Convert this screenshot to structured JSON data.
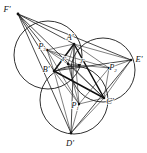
{
  "figure": {
    "type": "geometry-diagram",
    "background_color": "#ffffff",
    "stroke_color": "#1a1a1a",
    "width": 147,
    "height": 153
  },
  "labels": {
    "F_prime": "F'",
    "A_prime": "A'",
    "E_prime": "E'",
    "C_prime": "C'",
    "D_prime": "D'",
    "B_prime": "B'",
    "I_prime": "I'",
    "J_prime": "J'",
    "P1": "P",
    "P1_sub": "1",
    "P2": "P",
    "P2_sub": "2",
    "P3": "P",
    "P3_sub": "3"
  },
  "points": {
    "F_prime": {
      "x": 18,
      "y": 14
    },
    "A_prime": {
      "x": 74,
      "y": 44
    },
    "E_prime": {
      "x": 131,
      "y": 60
    },
    "C_prime": {
      "x": 104,
      "y": 98
    },
    "D_prime": {
      "x": 71,
      "y": 133
    },
    "B_prime": {
      "x": 54,
      "y": 71
    },
    "I_prime": {
      "x": 68,
      "y": 64
    },
    "J_prime": {
      "x": 79,
      "y": 65
    },
    "P1": {
      "x": 79,
      "y": 104
    },
    "P2": {
      "x": 109,
      "y": 68
    },
    "P3": {
      "x": 47,
      "y": 50
    }
  },
  "circles": [
    {
      "name": "circle-upper-left",
      "cx": 48,
      "cy": 55,
      "r": 34
    },
    {
      "name": "circle-right",
      "cx": 103,
      "cy": 70,
      "r": 32
    },
    {
      "name": "circle-bottom",
      "cx": 74,
      "cy": 100,
      "r": 34
    }
  ],
  "triangles": {
    "outer": [
      "F'",
      "E'",
      "D'"
    ],
    "inner": [
      "A'",
      "B'",
      "C'"
    ],
    "centers": [
      "P1",
      "P2",
      "P3"
    ]
  }
}
